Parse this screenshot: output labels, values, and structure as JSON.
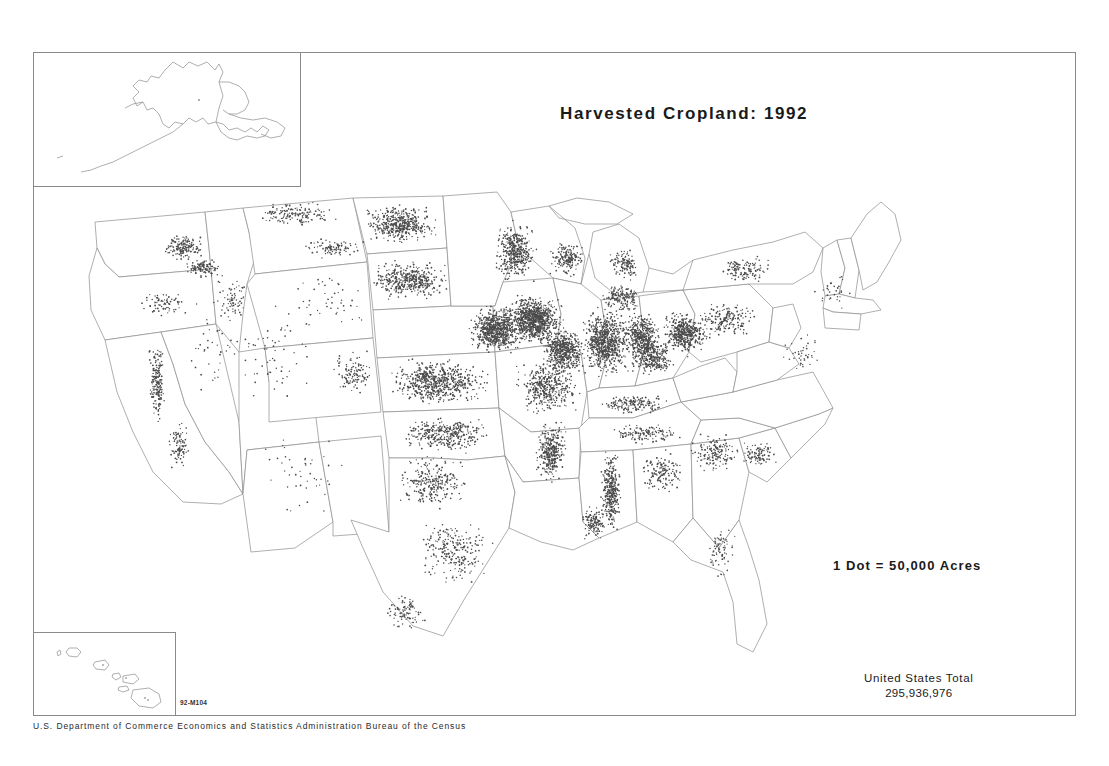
{
  "poster": {
    "title": "Harvested Cropland: 1992",
    "legend": "1 Dot  =  50,000  Acres",
    "total_label": "United States Total",
    "total_value": "295,936,976",
    "map_code": "92-M104",
    "agency_footer": "U.S. Department of Commerce   Economics and Statistics Administration   Bureau of the Census",
    "background_color": "#ffffff",
    "line_color": "#8d8d8d",
    "dot_color": "#4a4a4a",
    "text_color": "#1a1a1a"
  },
  "insets": {
    "alaska": {
      "name": "Alaska"
    },
    "hawaii": {
      "name": "Hawaii"
    }
  },
  "chart_data": {
    "type": "map",
    "title": "Harvested Cropland: 1992",
    "subtitle": "",
    "units": "acres",
    "dot_value": 50000,
    "dot_value_label": "1 Dot = 50,000 Acres",
    "national_total": 295936976,
    "national_total_label": "295,936,976",
    "source": "U.S. Department of Commerce, Economics and Statistics Administration, Bureau of the Census",
    "map_code": "92-M104",
    "projection_note": "Conterminous United States with Alaska and Hawaii insets",
    "legend_position": "right-center",
    "grid": false,
    "density_regions": [
      {
        "region": "Corn Belt (Iowa, Illinois, Indiana, Nebraska, Minnesota)",
        "density": "very high"
      },
      {
        "region": "Great Plains (Kansas, North Dakota, South Dakota, Oklahoma)",
        "density": "high"
      },
      {
        "region": "Mississippi Delta (Arkansas, Mississippi, Louisiana)",
        "density": "high"
      },
      {
        "region": "Eastern Washington Palouse",
        "density": "moderate"
      },
      {
        "region": "California Central Valley",
        "density": "moderate"
      },
      {
        "region": "Ohio Valley and Great Lakes",
        "density": "moderate"
      },
      {
        "region": "Southeastern Coastal Plain",
        "density": "low to moderate"
      },
      {
        "region": "Texas High Plains and Gulf Coast",
        "density": "moderate"
      },
      {
        "region": "Intermountain West (Nevada, Utah, Arizona, Wyoming)",
        "density": "very low"
      },
      {
        "region": "Northern New England",
        "density": "very low"
      }
    ]
  }
}
